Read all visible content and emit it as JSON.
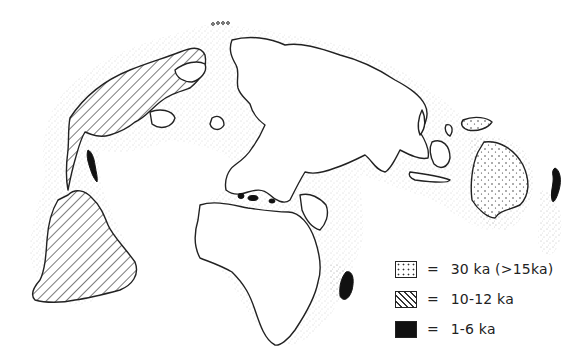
{
  "figure": {
    "type": "map",
    "regions": {
      "americas": {
        "pattern": "hatched",
        "legend_ref": 1
      },
      "sahul_australia_new_guinea": {
        "pattern": "dotted",
        "legend_ref": 0
      },
      "madagascar": {
        "pattern": "black",
        "legend_ref": 2
      },
      "new_zealand": {
        "pattern": "black",
        "legend_ref": 2
      },
      "caribbean_islands": {
        "pattern": "black",
        "legend_ref": 2
      },
      "mediterranean_islands": {
        "pattern": "black",
        "legend_ref": 2
      },
      "afro_eurasia": {
        "pattern": "blank"
      }
    }
  },
  "legend": {
    "items": [
      {
        "pattern": "dotted",
        "symbol": "=",
        "label": "30 ka (>15ka)"
      },
      {
        "pattern": "hatched",
        "symbol": "=",
        "label": "10-12 ka"
      },
      {
        "pattern": "black",
        "symbol": "=",
        "label": "1-6 ka"
      }
    ]
  },
  "colors": {
    "ink": "#222222",
    "fill_black": "#111111",
    "background": "#ffffff"
  }
}
